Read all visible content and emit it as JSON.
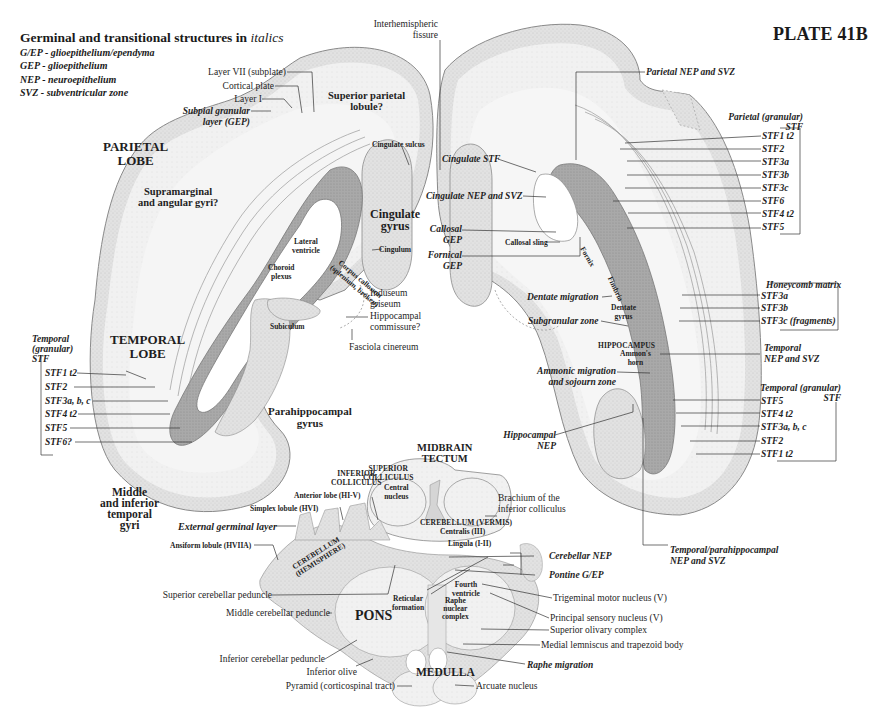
{
  "plate": {
    "title": "PLATE 41B"
  },
  "legend": {
    "title_prefix": "Germinal and transitional structures in ",
    "title_emphasis": "italics",
    "items": [
      "G/EP - glioepithelium/ependyma",
      "GEP - glioepithelium",
      "NEP - neuroepithelium",
      "SVZ - subventricular zone"
    ]
  },
  "left_hemisphere": {
    "lobes": {
      "parietal": [
        "PARIETAL",
        "LOBE"
      ],
      "temporal": [
        "TEMPORAL",
        "LOBE"
      ]
    },
    "gyri": {
      "superior_parietal": [
        "Superior parietal",
        "lobule?"
      ],
      "supramarginal": [
        "Supramarginal",
        "and angular gyri?"
      ],
      "cingulate_gyrus": [
        "Cingulate",
        "gyrus"
      ],
      "parahippocampal": [
        "Parahippocampal",
        "gyrus"
      ],
      "middle_inferior_temporal": [
        "Middle",
        "and inferior",
        "temporal",
        "gyri"
      ]
    },
    "cortex_labels": {
      "layer_vii": "Layer VII (subplate)",
      "cortical_plate": "Cortical plate",
      "layer_i": "Layer I",
      "subpial": [
        "Subpial granular",
        "layer (GEP)"
      ]
    },
    "medial_labels": {
      "cingulate_sulcus": "Cingulate sulcus",
      "cingulum": "Cingulum",
      "lateral_ventricle": [
        "Lateral",
        "ventricle"
      ],
      "choroid_plexus": [
        "Choroid",
        "plexus"
      ],
      "corpus_callosum": [
        "Corpus callosum",
        "(splenium, broken)"
      ],
      "induseum": [
        "Induseum",
        "griseum"
      ],
      "hippocampal_commissure": [
        "Hippocampal",
        "commissure?"
      ],
      "subiculum": "Subiculum",
      "fasciola": "Fasciola cinereum",
      "interhemispheric": [
        "Interhemispheric",
        "fissure"
      ]
    },
    "temporal_stf": {
      "header": [
        "Temporal",
        "(granular)",
        "STF"
      ],
      "items": [
        "STF1 t2",
        "STF2",
        "STF3a, b, c",
        "STF4 t2",
        "STF5",
        "STF6?"
      ]
    }
  },
  "right_hemisphere": {
    "parietal_nep": "Parietal NEP and SVZ",
    "parietal_stf": {
      "header": [
        "Parietal (granular)",
        "STF"
      ],
      "items": [
        "STF1 t2",
        "STF2",
        "STF3a",
        "STF3b",
        "STF3c",
        "STF6",
        "STF4 t2",
        "STF5"
      ]
    },
    "medial_labels": {
      "cingulate_stf": "Cingulate STF",
      "cingulate_nep": "Cingulate NEP and SVZ",
      "callosal_gep": [
        "Callosal",
        "GEP"
      ],
      "callosal_sling": "Callosal sling",
      "fornical_gep": [
        "Fornical",
        "GEP"
      ],
      "fornix": "Fornix",
      "fimbria": "Fimbria",
      "dentate_migration": "Dentate migration",
      "dentate_gyrus": [
        "Dentate",
        "gyrus"
      ],
      "subgranular": "Subgranular zone",
      "hippocampus": "HIPPOCAMPUS",
      "ammons_horn": [
        "Ammon's",
        "horn"
      ],
      "ammonic_migration": [
        "Ammonic migration",
        "and sojourn zone"
      ],
      "hippocampal_nep": [
        "Hippocampal",
        "NEP"
      ],
      "temporal_parahippo_nep": [
        "Temporal/parahippocampal",
        "NEP and SVZ"
      ]
    },
    "honeycomb": {
      "header": "Honeycomb matrix",
      "items": [
        "STF3a",
        "STF3b",
        "STF3c (fragments)"
      ]
    },
    "temporal_nep": [
      "Temporal",
      "NEP and SVZ"
    ],
    "temporal_stf": {
      "header": [
        "Temporal (granular)",
        "STF"
      ],
      "items": [
        "STF5",
        "STF4 t2",
        "STF3a, b, c",
        "STF2",
        "STF1 t2"
      ]
    }
  },
  "brainstem": {
    "midbrain": [
      "MIDBRAIN",
      "TECTUM"
    ],
    "superior_colliculus": [
      "SUPERIOR",
      "COLLICULUS"
    ],
    "inferior_colliculus": [
      "INFERIOR",
      "COLLICULUS"
    ],
    "central_nucleus": [
      "Central",
      "nucleus"
    ],
    "brachium": [
      "Brachium of the",
      "inferior colliculus"
    ],
    "cerebellum_vermis": "CEREBELLUM (VERMIS)",
    "centralis": "Centralis (III)",
    "lingula": "Lingula (I-II)",
    "anterior_lobe": "Anterior lobe (HI-V)",
    "simplex_lobule": "Simplex lobule (HVI)",
    "external_germinal": "External germinal layer",
    "ansiform_lobule": "Ansiform lobule (HVIIA)",
    "cerebellum_hemisphere": [
      "CEREBELLUM",
      "(HEMISPHERE)"
    ],
    "cerebellar_nep": "Cerebellar NEP",
    "pontine_gep": "Pontine G/EP",
    "fourth_ventricle": [
      "Fourth",
      "ventricle"
    ],
    "reticular_formation": [
      "Reticular",
      "formation"
    ],
    "raphe_complex": [
      "Raphe",
      "nuclear",
      "complex"
    ],
    "pons": "PONS",
    "medulla": "MEDULLA",
    "left_labels": [
      "Superior cerebellar peduncle",
      "Middle cerebellar peduncle",
      "Inferior cerebellar peduncle",
      "Inferior olive",
      "Pyramid (corticospinal tract)"
    ],
    "right_labels": [
      "Trigeminal motor nucleus (V)",
      "Principal sensory nucleus (V)",
      "Superior olivary complex",
      "Medial lemniscus and trapezoid body",
      "Raphe migration",
      "Arcuate nucleus"
    ]
  }
}
